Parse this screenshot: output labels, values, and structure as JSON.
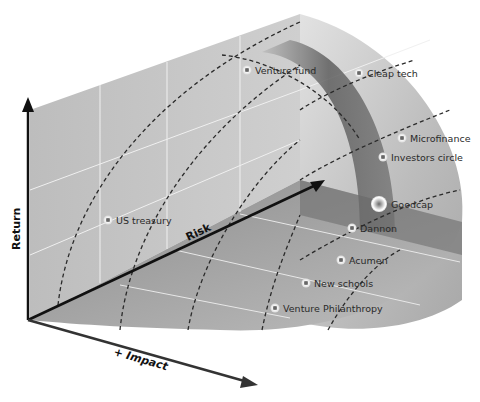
{
  "axes": {
    "return": "Return",
    "risk": "Risk",
    "impact": "+ Impact"
  },
  "points": [
    {
      "label": "Venture fund",
      "x": 247,
      "y": 70,
      "large": false
    },
    {
      "label": "Cleap tech",
      "x": 359,
      "y": 73,
      "large": false
    },
    {
      "label": "Microfinance",
      "x": 402,
      "y": 138,
      "large": false
    },
    {
      "label": "Investors circle",
      "x": 383,
      "y": 157,
      "large": false
    },
    {
      "label": "Goodcap",
      "x": 379,
      "y": 204,
      "large": true
    },
    {
      "label": "US treasury",
      "x": 108,
      "y": 220,
      "large": false
    },
    {
      "label": "Dannon",
      "x": 352,
      "y": 228,
      "large": false
    },
    {
      "label": "Acumen",
      "x": 341,
      "y": 260,
      "large": false
    },
    {
      "label": "New schools",
      "x": 306,
      "y": 283,
      "large": false
    },
    {
      "label": "Venture Philanthropy",
      "x": 275,
      "y": 308,
      "large": false
    }
  ],
  "colors": {
    "wall": "#b8b8b8",
    "floor": "#9a9a9a",
    "arc_band": "#6e6e6e",
    "axis": "#111111"
  }
}
